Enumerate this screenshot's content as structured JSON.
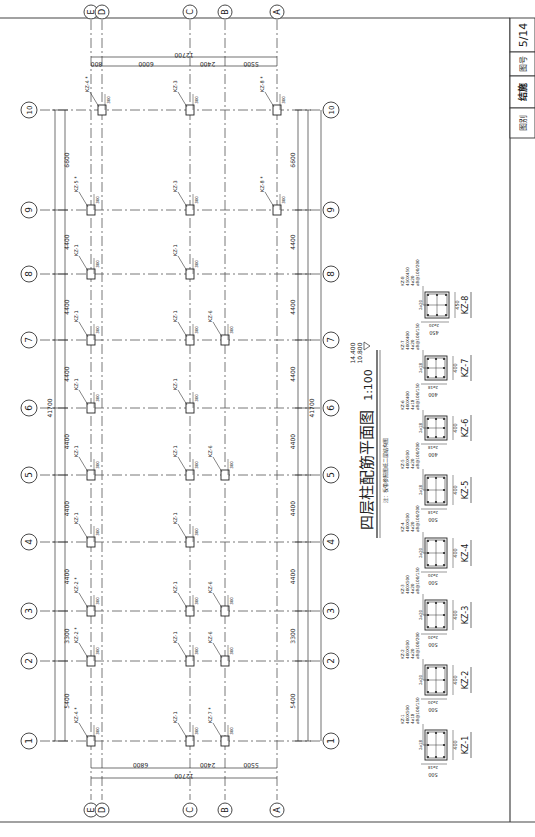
{
  "title_block": {
    "sheet_number": "5/14",
    "sheet_no_label": "图号",
    "discipline": "结施",
    "category_label": "图别"
  },
  "drawing": {
    "title": "四层柱配筋平面图",
    "scale": "1:100",
    "elevation_top": "14.400",
    "elevation_bottom": "10.800",
    "note": "注：板带参照图纸二层结构图"
  },
  "axes_numbered": [
    {
      "label": "1",
      "y": 741
    },
    {
      "label": "2",
      "y": 661
    },
    {
      "label": "3",
      "y": 611
    },
    {
      "label": "4",
      "y": 542
    },
    {
      "label": "5",
      "y": 475
    },
    {
      "label": "6",
      "y": 408
    },
    {
      "label": "7",
      "y": 340
    },
    {
      "label": "8",
      "y": 274
    },
    {
      "label": "9",
      "y": 210
    },
    {
      "label": "10",
      "y": 110
    }
  ],
  "axes_lettered": [
    {
      "label": "E",
      "x": 91
    },
    {
      "label": "D",
      "x": 102
    },
    {
      "label": "C",
      "x": 190
    },
    {
      "label": "B",
      "x": 225
    },
    {
      "label": "A",
      "x": 277
    }
  ],
  "dims_numbered": [
    "5400",
    "3300",
    "4400",
    "4400",
    "4400",
    "4400",
    "4400",
    "4400",
    "6600"
  ],
  "dims_numbered_total": "41700",
  "dims_lettered_top": [
    "800",
    "6000",
    "2400",
    "5500"
  ],
  "dims_lettered_bottom": [
    "6800",
    "2400",
    "5500"
  ],
  "dims_lettered_total": "12700",
  "column_tags": [
    {
      "label": "KZ-4 *",
      "axis": "10",
      "col": "D"
    },
    {
      "label": "KZ-3",
      "axis": "10",
      "col": "C"
    },
    {
      "label": "KZ-8 *",
      "axis": "10",
      "col": "A"
    },
    {
      "label": "KZ-5 *",
      "axis": "9",
      "col": "E"
    },
    {
      "label": "KZ-3",
      "axis": "9",
      "col": "C"
    },
    {
      "label": "KZ-8 *",
      "axis": "9",
      "col": "A"
    },
    {
      "label": "KZ-1",
      "axis": "8",
      "col": "E"
    },
    {
      "label": "KZ-1",
      "axis": "8",
      "col": "C"
    },
    {
      "label": "KZ-1",
      "axis": "7",
      "col": "E"
    },
    {
      "label": "KZ-1",
      "axis": "7",
      "col": "C"
    },
    {
      "label": "KZ-6",
      "axis": "7",
      "col": "B"
    },
    {
      "label": "KZ-1",
      "axis": "6",
      "col": "E"
    },
    {
      "label": "KZ-1",
      "axis": "6",
      "col": "C"
    },
    {
      "label": "KZ-1",
      "axis": "5",
      "col": "E"
    },
    {
      "label": "KZ-1",
      "axis": "5",
      "col": "C"
    },
    {
      "label": "KZ-6",
      "axis": "5",
      "col": "B"
    },
    {
      "label": "KZ-1",
      "axis": "4",
      "col": "E"
    },
    {
      "label": "KZ-1",
      "axis": "4",
      "col": "C"
    },
    {
      "label": "KZ-2 *",
      "axis": "3",
      "col": "E"
    },
    {
      "label": "KZ-1",
      "axis": "3",
      "col": "C"
    },
    {
      "label": "KZ-6",
      "axis": "3",
      "col": "B"
    },
    {
      "label": "KZ-2 *",
      "axis": "2",
      "col": "E"
    },
    {
      "label": "KZ-1",
      "axis": "2",
      "col": "C"
    },
    {
      "label": "KZ-6",
      "axis": "2",
      "col": "B"
    },
    {
      "label": "KZ-4 *",
      "axis": "1",
      "col": "E"
    },
    {
      "label": "KZ-1",
      "axis": "1",
      "col": "C"
    },
    {
      "label": "KZ-7 *",
      "axis": "1",
      "col": "B"
    }
  ],
  "column_details": [
    {
      "name": "KZ-1",
      "b": "500",
      "h": "400",
      "spec1": "400X500",
      "spec2": "4⌀18",
      "spec3": "⌀8@100/150",
      "side": "2⌀18",
      "y": 745
    },
    {
      "name": "KZ-2",
      "b": "500",
      "h": "400",
      "spec1": "400X500",
      "spec2": "4⌀20",
      "spec3": "⌀8@100/200",
      "side": "2⌀20",
      "y": 680
    },
    {
      "name": "KZ-3",
      "b": "500",
      "h": "400",
      "spec1": "400X500",
      "spec2": "4⌀20",
      "spec3": "⌀8@100/150",
      "side": "2⌀20",
      "y": 615
    },
    {
      "name": "KZ-4",
      "b": "500",
      "h": "400",
      "spec1": "400X500",
      "spec2": "4⌀20",
      "spec3": "⌀8@100/200",
      "side": "2⌀20",
      "y": 553
    },
    {
      "name": "KZ-5",
      "b": "500",
      "h": "400",
      "spec1": "400X500",
      "spec2": "4⌀20",
      "spec3": "⌀8@100/200",
      "side": "2⌀18",
      "y": 490
    },
    {
      "name": "KZ-6",
      "b": "400",
      "h": "400",
      "spec1": "400X400",
      "spec2": "4⌀18",
      "spec3": "⌀8@100/150",
      "side": "2⌀18",
      "y": 428
    },
    {
      "name": "KZ-7",
      "b": "400",
      "h": "400",
      "spec1": "400X400",
      "spec2": "4⌀20",
      "spec3": "⌀8@100/150",
      "side": "2⌀18",
      "y": 368
    },
    {
      "name": "KZ-8",
      "b": "450",
      "h": "450",
      "spec1": "450X450",
      "spec2": "4⌀20",
      "spec3": "⌀8@100/200",
      "side": "2⌀20",
      "y": 305
    }
  ]
}
